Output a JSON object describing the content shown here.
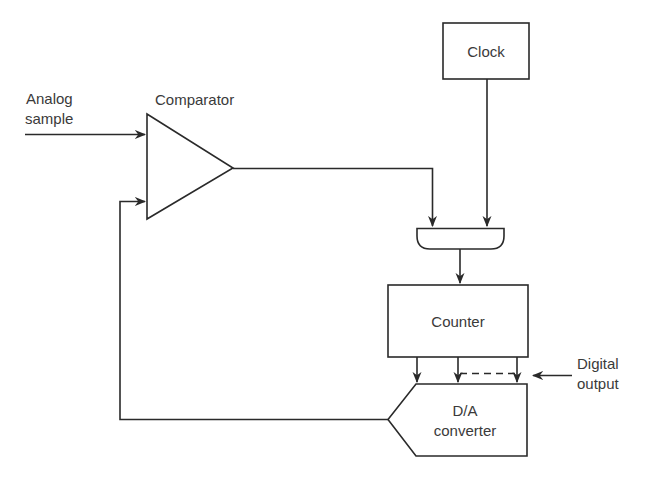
{
  "diagram": {
    "type": "block-diagram",
    "inputs": {
      "analog_sample": {
        "line1": "Analog",
        "line2": "sample"
      }
    },
    "blocks": {
      "comparator": {
        "label": "Comparator",
        "shape": "triangle"
      },
      "clock": {
        "label": "Clock",
        "shape": "rectangle"
      },
      "and_gate": {
        "label": "",
        "shape": "and-gate"
      },
      "counter": {
        "label": "Counter",
        "shape": "rectangle"
      },
      "dac": {
        "line1": "D/A",
        "line2": "converter",
        "shape": "pentagon"
      }
    },
    "outputs": {
      "digital_output": {
        "line1": "Digital",
        "line2": "output"
      }
    },
    "connections": [
      {
        "from": "analog_sample",
        "to": "comparator"
      },
      {
        "from": "dac",
        "to": "comparator",
        "type": "feedback"
      },
      {
        "from": "comparator",
        "to": "and_gate"
      },
      {
        "from": "clock",
        "to": "and_gate"
      },
      {
        "from": "and_gate",
        "to": "counter"
      },
      {
        "from": "counter",
        "to": "dac",
        "type": "parallel-bits"
      },
      {
        "from": "digital_output",
        "to": "counter-dac-bus"
      }
    ],
    "colors": {
      "line": "#2a2a2a",
      "text": "#3a3a3a",
      "background": "#ffffff"
    }
  }
}
